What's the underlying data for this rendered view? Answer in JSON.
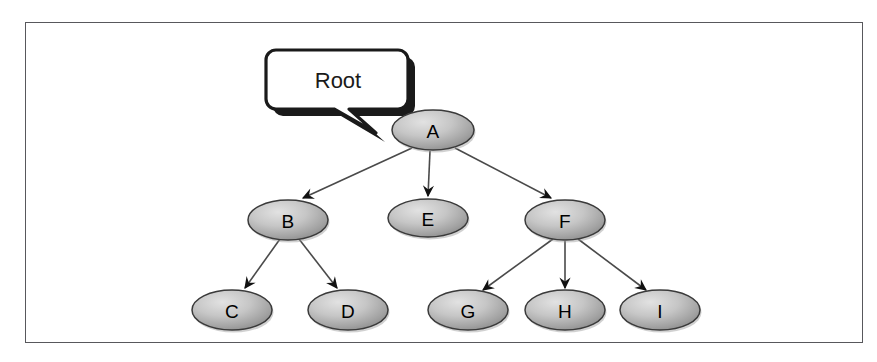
{
  "figure": {
    "kind": "tree-diagram",
    "frame_border_color": "#58585c",
    "background_color": "#ffffff"
  },
  "callout": {
    "label": "Root",
    "target_node": "A",
    "fill_color": "#ffffff",
    "border_color": "#1a1a1a",
    "shadow_color": "#1a1a1a"
  },
  "style": {
    "node_fill_light": "#d8d8d8",
    "node_fill_dark": "#8e8e8e",
    "node_stroke": "#3a3a3a",
    "edge_color": "#4a4a4a",
    "arrow_color": "#111111"
  },
  "nodes": [
    {
      "id": "A",
      "label": "A",
      "cx": 433,
      "cy": 130,
      "rx": 41,
      "ry": 20
    },
    {
      "id": "B",
      "label": "B",
      "cx": 288,
      "cy": 220,
      "rx": 40,
      "ry": 20
    },
    {
      "id": "E",
      "label": "E",
      "cx": 428,
      "cy": 218,
      "rx": 40,
      "ry": 19
    },
    {
      "id": "F",
      "label": "F",
      "cx": 565,
      "cy": 220,
      "rx": 40,
      "ry": 20
    },
    {
      "id": "C",
      "label": "C",
      "cx": 232,
      "cy": 310,
      "rx": 40,
      "ry": 20
    },
    {
      "id": "D",
      "label": "D",
      "cx": 348,
      "cy": 310,
      "rx": 40,
      "ry": 20
    },
    {
      "id": "G",
      "label": "G",
      "cx": 468,
      "cy": 310,
      "rx": 40,
      "ry": 20
    },
    {
      "id": "H",
      "label": "H",
      "cx": 565,
      "cy": 310,
      "rx": 40,
      "ry": 20
    },
    {
      "id": "I",
      "label": "I",
      "cx": 660,
      "cy": 310,
      "rx": 40,
      "ry": 20
    }
  ],
  "edges": [
    {
      "from": "A",
      "to": "B",
      "x1": 412,
      "y1": 148,
      "x2": 303,
      "y2": 198
    },
    {
      "from": "A",
      "to": "E",
      "x1": 430,
      "y1": 151,
      "x2": 428,
      "y2": 196
    },
    {
      "from": "A",
      "to": "F",
      "x1": 455,
      "y1": 148,
      "x2": 551,
      "y2": 198
    },
    {
      "from": "B",
      "to": "C",
      "x1": 280,
      "y1": 239,
      "x2": 245,
      "y2": 288
    },
    {
      "from": "B",
      "to": "D",
      "x1": 299,
      "y1": 239,
      "x2": 337,
      "y2": 288
    },
    {
      "from": "F",
      "to": "G",
      "x1": 553,
      "y1": 239,
      "x2": 483,
      "y2": 290
    },
    {
      "from": "F",
      "to": "H",
      "x1": 565,
      "y1": 241,
      "x2": 565,
      "y2": 288
    },
    {
      "from": "F",
      "to": "I",
      "x1": 578,
      "y1": 239,
      "x2": 646,
      "y2": 290
    }
  ],
  "tree_structure": {
    "root": "A",
    "children": {
      "A": [
        "B",
        "E",
        "F"
      ],
      "B": [
        "C",
        "D"
      ],
      "F": [
        "G",
        "H",
        "I"
      ]
    }
  }
}
